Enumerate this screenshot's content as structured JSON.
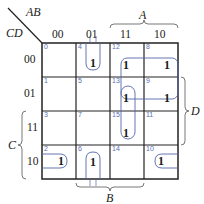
{
  "kmap": {
    "row_var": "CD",
    "col_var": "AB",
    "col_headers": [
      "00",
      "01",
      "11",
      "10"
    ],
    "row_headers": [
      "00",
      "01",
      "11",
      "10"
    ],
    "cells": [
      [
        "0",
        "4",
        "12",
        "8"
      ],
      [
        "1",
        "5",
        "13",
        "9"
      ],
      [
        "3",
        "7",
        "15",
        "11"
      ],
      [
        "2",
        "6",
        "14",
        "10"
      ]
    ],
    "values": [
      [
        "",
        "1",
        "1",
        "1"
      ],
      [
        "",
        "",
        "1",
        "1"
      ],
      [
        "",
        "",
        "1",
        ""
      ],
      [
        "1",
        "1",
        "",
        "1"
      ]
    ],
    "one_label": "1",
    "brace_labels": {
      "A": "A",
      "B": "B",
      "C": "C",
      "D": "D"
    },
    "loops": [
      {
        "name": "quad-12-8-13-9",
        "cells": [
          12,
          8,
          13,
          9
        ]
      },
      {
        "name": "pair-13-15",
        "cells": [
          13,
          15
        ]
      },
      {
        "name": "wrap-pair-4-6",
        "cells": [
          4,
          6
        ]
      },
      {
        "name": "wrap-pair-2-10",
        "cells": [
          2,
          10
        ]
      }
    ],
    "colors": {
      "grid": "#222222",
      "loop": "#5566aa",
      "minterm": "#5a6fb5"
    }
  }
}
